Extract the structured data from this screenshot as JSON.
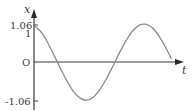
{
  "chart_data": {
    "type": "line",
    "title": "",
    "xlabel": "t",
    "ylabel": "x",
    "y_ticks": [
      {
        "label": "1.06",
        "value": 1.06
      },
      {
        "label": "1",
        "value": 1.0
      },
      {
        "label": "O",
        "value": 0
      },
      {
        "label": "-1.06",
        "value": -1.06
      }
    ],
    "ylim": [
      -1.06,
      1.06
    ],
    "grid": false,
    "legend": null,
    "series": [
      {
        "name": "x(t)",
        "description": "sinusoidal oscillation x = 1.06 cos(ωt - φ), starting at x = 1 at t = 0",
        "amplitude": 1.06,
        "initial_value": 1.0,
        "x": [
          0,
          0.5,
          1,
          1.5,
          2,
          2.5,
          3,
          3.5,
          4,
          4.5,
          5,
          5.5,
          6,
          6.5,
          7,
          7.5,
          8,
          8.5,
          9,
          9.5,
          10,
          10.5
        ],
        "values": [
          1.0,
          0.82,
          0.52,
          0.16,
          -0.21,
          -0.55,
          -0.84,
          -1.01,
          -1.06,
          -0.97,
          -0.76,
          -0.46,
          -0.11,
          0.26,
          0.59,
          0.86,
          1.02,
          1.05,
          0.96,
          0.74,
          0.44,
          0.09
        ]
      }
    ],
    "colors": {
      "axis": "#3a3a3a",
      "curve": "#8a8a8a"
    }
  },
  "labels": {
    "y_axis": "x",
    "x_axis": "t",
    "tick_top": "1.06",
    "tick_one": "1",
    "origin": "O",
    "tick_bottom": "-1.06"
  }
}
